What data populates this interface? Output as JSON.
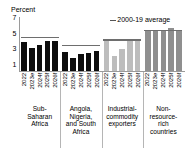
{
  "chart_data": {
    "type": "bar",
    "title": "",
    "subtitle": "",
    "unit_label": "Percent",
    "xlabel": "",
    "ylabel": "",
    "ylim": [
      0,
      7
    ],
    "yticks": [
      7,
      5,
      3,
      1
    ],
    "grid": false,
    "legend_position": "top-right",
    "legend": [
      {
        "label": "2000-19 average",
        "marker": "line",
        "color": "#6e6e6e"
      }
    ],
    "categories": [
      "2022",
      "2023e",
      "2024f",
      "2025f",
      "2026f"
    ],
    "groups": [
      {
        "name": "Sub-Saharan Africa",
        "caption": "Sub-\nSaharan\nAfrica",
        "color": "#0d0d0d",
        "values": [
          3.8,
          3.0,
          3.4,
          3.9,
          4.0
        ],
        "average_2000_19": 4.3
      },
      {
        "name": "Angola, Nigeria, and South Africa",
        "caption": "Angola,\nNigeria,\nand South\nAfrica",
        "color": "#0d0d0d",
        "values": [
          2.5,
          1.8,
          2.3,
          2.4,
          2.7
        ],
        "average_2000_19": 3.3
      },
      {
        "name": "Industrial-commodity exporters",
        "caption": "Industrial-\ncommodity\nexporters",
        "color": "#bdbdbd",
        "values": [
          4.0,
          2.0,
          2.9,
          4.0,
          4.0
        ],
        "average_2000_19": 4.0
      },
      {
        "name": "Non-resource-rich countries",
        "caption": "Non-\nresource-\nrich\ncountries",
        "color": "#8f8f8f",
        "values": [
          5.3,
          5.4,
          5.4,
          5.6,
          5.3
        ],
        "average_2000_19": 5.2
      }
    ]
  }
}
